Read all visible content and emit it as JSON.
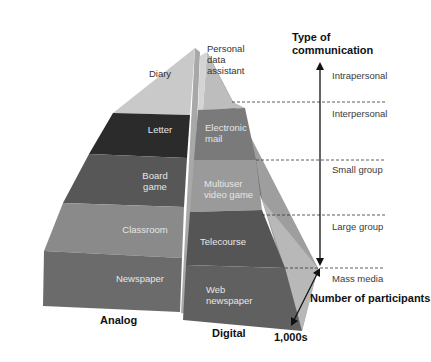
{
  "axis": {
    "type_title": "Type of\ncommunication",
    "participants_title": "Number of participants",
    "participants_max": "1,000s"
  },
  "columns": {
    "analog": "Analog",
    "digital": "Digital"
  },
  "levels": [
    {
      "type": "Intrapersonal",
      "analog": "Diary",
      "digital": "Personal\ndata\nassistant"
    },
    {
      "type": "Interpersonal",
      "analog": "Letter",
      "digital": "Electronic\nmail"
    },
    {
      "type": "Small group",
      "analog": "Board\ngame",
      "digital": "Multiuser\nvideo game"
    },
    {
      "type": "Large group",
      "analog": "Classroom",
      "digital": "Telecourse"
    },
    {
      "type": "Mass media",
      "analog": "Newspaper",
      "digital": "Web\nnewspaper"
    }
  ],
  "colors": {
    "diary": "#c9c9c9",
    "letter": "#2b2b2b",
    "board": "#575757",
    "classroom": "#8a8a8a",
    "newspaper": "#6b6b6b",
    "pda": "#bdbdbd",
    "email": "#7a7a7a",
    "multiuser": "#9a9a9a",
    "telecourse": "#555555",
    "webnews": "#606060",
    "side_light": "#b5b5b5",
    "side_dark": "#8c8c8c"
  }
}
